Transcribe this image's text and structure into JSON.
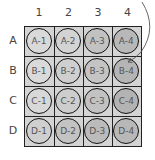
{
  "columns": [
    "1",
    "2",
    "3",
    "4"
  ],
  "rows": [
    "A",
    "B",
    "C",
    "D"
  ],
  "wells": [
    [
      {
        "label": "A-1",
        "color": "#d9d9d9"
      },
      {
        "label": "A-2",
        "color": "#d3d3d3"
      },
      {
        "label": "A-3",
        "color": "#c2c2c2"
      },
      {
        "label": "A-4",
        "color": "#b8b8b8"
      }
    ],
    [
      {
        "label": "B-1",
        "color": "#dadada"
      },
      {
        "label": "B-2",
        "color": "#cfcfcf"
      },
      {
        "label": "B-3",
        "color": "#c4c4c4"
      },
      {
        "label": "B-4",
        "color": "#b5b5b5"
      }
    ],
    [
      {
        "label": "C-1",
        "color": "#d8d8d8"
      },
      {
        "label": "C-2",
        "color": "#cdcdcd"
      },
      {
        "label": "C-3",
        "color": "#c2c2c2"
      },
      {
        "label": "C-4",
        "color": "#b3b3b3"
      }
    ],
    [
      {
        "label": "D-1",
        "color": "#cfcfcf"
      },
      {
        "label": "D-2",
        "color": "#c3c3c3"
      },
      {
        "label": "D-3",
        "color": "#bbbbbb"
      },
      {
        "label": "D-4",
        "color": "#b8b8b8"
      }
    ]
  ],
  "colors": {
    "plate_background": "#d4d4d4",
    "grid_line": "#222222",
    "label_text": "#444444",
    "arrow": "#555555"
  },
  "annotation": {
    "type": "curved-arrow",
    "target": "B-4"
  }
}
